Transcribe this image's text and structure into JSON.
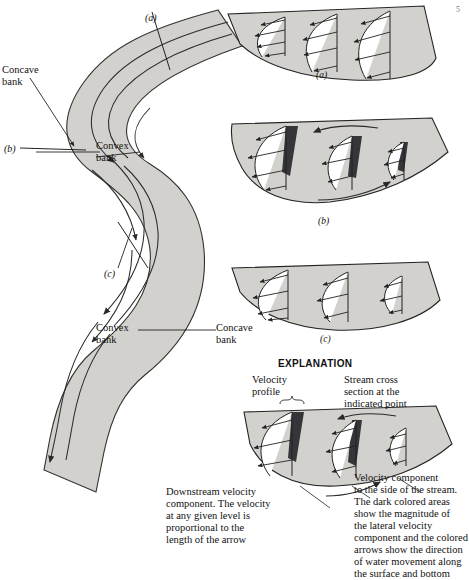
{
  "figure": {
    "title_mark": "5",
    "channel": {
      "fill_color": "#d3d1cd",
      "outline_color": "#33312e",
      "flow_arrow_color": "#2a2a2a"
    },
    "section_markers": [
      {
        "id": "a",
        "label": "(a)"
      },
      {
        "id": "b",
        "label": "(b)"
      },
      {
        "id": "c",
        "label": "(c)"
      }
    ],
    "bank_labels": [
      {
        "id": "concave-upper",
        "line1": "Concave",
        "line2": "bank"
      },
      {
        "id": "convex-upper",
        "line1": "Convex",
        "line2": "bank"
      },
      {
        "id": "convex-lower",
        "line1": "Convex",
        "line2": "bank"
      },
      {
        "id": "concave-lower",
        "line1": "Concave",
        "line2": "bank"
      }
    ],
    "cross_sections": [
      {
        "id": "a",
        "caption": "(a)",
        "shape": "symmetric",
        "dark_wedges": false,
        "lateral_arrows": false
      },
      {
        "id": "b",
        "caption": "(b)",
        "shape": "asymmetric-left-deep",
        "dark_wedges": true,
        "lateral_arrows": true
      },
      {
        "id": "c",
        "caption": "(c)",
        "shape": "asymmetric-left-deep-shallow",
        "dark_wedges": false,
        "lateral_arrows": false
      }
    ],
    "explanation": {
      "heading": "EXPLANATION",
      "velocity_profile_label": {
        "line1": "Velocity",
        "line2": "profile"
      },
      "stream_section_label": {
        "line1": "Stream cross",
        "line2": "section at the",
        "line3": "indicated point"
      },
      "downstream_note": {
        "line1": "Downstream velocity",
        "line2": "component. The velocity",
        "line3": "at any given level is",
        "line4": "proportional to the",
        "line5": "length of the arrow"
      },
      "lateral_note": {
        "line1": "Velocity component",
        "line2": "to the side of the stream.",
        "line3": "The dark colored areas",
        "line4": "show the magnitude of",
        "line5": "the lateral velocity",
        "line6": "component and the colored",
        "line7": "arrows show the direction",
        "line8": "of water movement along",
        "line9": "the surface and bottom"
      },
      "dark_wedge_color": "#35353a"
    }
  }
}
